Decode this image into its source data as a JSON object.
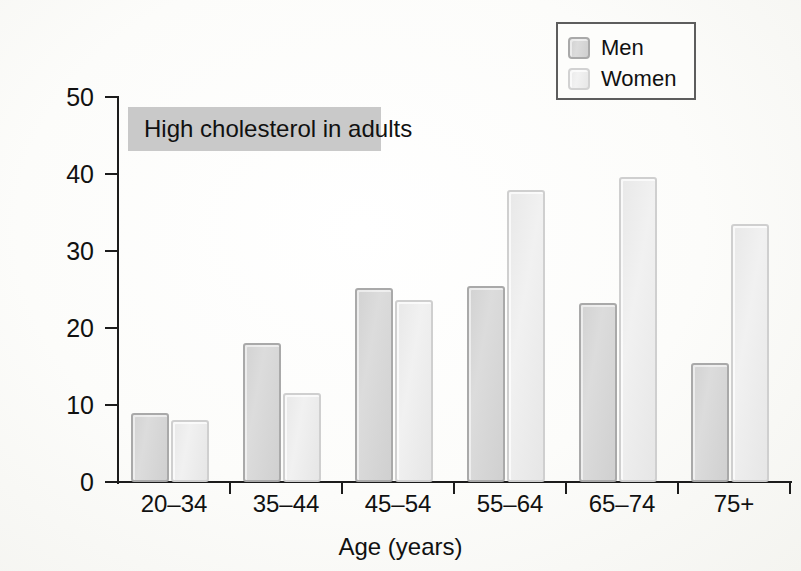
{
  "chart_data": {
    "type": "bar",
    "title": "High cholesterol in adults",
    "xlabel": "Age (years)",
    "ylabel": "% with high cholesterol",
    "categories": [
      "20–34",
      "35–44",
      "45–54",
      "55–64",
      "65–74",
      "75+"
    ],
    "series": [
      {
        "name": "Men",
        "color": "#d5d5d5",
        "values": [
          9.0,
          18.0,
          25.2,
          25.4,
          23.3,
          15.5
        ]
      },
      {
        "name": "Women",
        "color": "#ebebeb",
        "values": [
          8.0,
          11.5,
          23.7,
          37.9,
          39.6,
          33.5
        ]
      }
    ],
    "ylim": [
      0,
      50
    ],
    "yticks": [
      0,
      10,
      20,
      30,
      40,
      50
    ],
    "ytick_labels": [
      "0",
      "10",
      "20",
      "30",
      "40",
      "50"
    ],
    "grid": false,
    "legend_position": "top-right",
    "legend_entries": [
      "Men",
      "Women"
    ]
  },
  "legend": {
    "men_label": "Men",
    "women_label": "Women"
  },
  "axes": {
    "x_title": "Age (years)",
    "y_title": "% with high cholesterol"
  },
  "banner": {
    "text": "High cholesterol in adults"
  }
}
